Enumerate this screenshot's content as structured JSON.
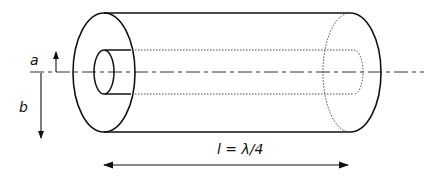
{
  "diagram": {
    "labels": {
      "inner_radius": "a",
      "outer_radius": "b",
      "length": "l = λ/4"
    },
    "colors": {
      "stroke": "#111111",
      "background": "#ffffff"
    }
  }
}
